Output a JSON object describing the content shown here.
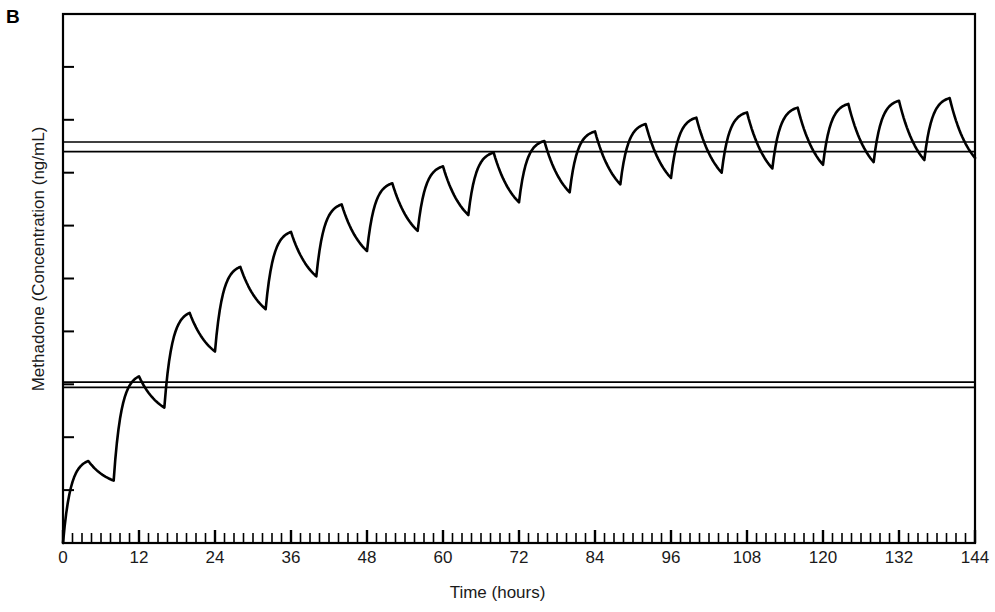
{
  "figure": {
    "panel_label": "B",
    "background": "#ffffff",
    "line_color": "#000000"
  },
  "chart_data": {
    "type": "line",
    "title": "",
    "subtitle": "",
    "panel": "B",
    "xlabel": "Time (hours)",
    "ylabel": "Methadone (Concentration (ng/mL)",
    "xlim": [
      0,
      144
    ],
    "ylim": [
      0,
      10
    ],
    "grid": false,
    "legend": null,
    "xticks": [
      0,
      12,
      24,
      36,
      48,
      60,
      72,
      84,
      96,
      108,
      120,
      132,
      144
    ],
    "xticklabels": [
      "0",
      "12",
      "24",
      "36",
      "48",
      "60",
      "72",
      "84",
      "96",
      "108",
      "120",
      "132",
      "144"
    ],
    "x_minor_tick_interval": 1.5,
    "yticks": [
      1,
      2,
      3,
      4,
      5,
      6,
      7,
      8,
      9
    ],
    "yticklabels": [
      "",
      "",
      "",
      "",
      "",
      "",
      "",
      "",
      ""
    ],
    "y_axis_labeled": false,
    "dose_interval_hours": 8,
    "doses": 18,
    "annotations": [],
    "reference_lines": [
      {
        "name": "upper-band-top",
        "y": 7.58,
        "style": "solid",
        "color": "#000000"
      },
      {
        "name": "upper-band-bottom",
        "y": 7.4,
        "style": "solid",
        "color": "#000000"
      },
      {
        "name": "lower-band-top",
        "y": 3.04,
        "style": "solid",
        "color": "#000000"
      },
      {
        "name": "lower-band-bottom",
        "y": 2.94,
        "style": "solid",
        "color": "#000000"
      }
    ],
    "series": [
      {
        "name": "Methadone concentration",
        "color": "#000000",
        "peaks_x": [
          4,
          12,
          20,
          28,
          36,
          44,
          52,
          60,
          68,
          76,
          84,
          92,
          100,
          108,
          116,
          124,
          132,
          140
        ],
        "peaks_y": [
          1.55,
          3.15,
          4.35,
          5.22,
          5.88,
          6.4,
          6.8,
          7.12,
          7.38,
          7.6,
          7.78,
          7.92,
          8.04,
          8.14,
          8.23,
          8.3,
          8.36,
          8.41
        ],
        "troughs_x": [
          8,
          16,
          24,
          32,
          40,
          48,
          56,
          64,
          72,
          80,
          88,
          96,
          104,
          112,
          120,
          128,
          136,
          144
        ],
        "troughs_y": [
          1.18,
          2.56,
          3.62,
          4.42,
          5.04,
          5.52,
          5.9,
          6.2,
          6.44,
          6.63,
          6.78,
          6.9,
          7.0,
          7.08,
          7.15,
          7.2,
          7.24,
          7.28
        ],
        "start_point": {
          "x": 0,
          "y": 0
        },
        "end_point": {
          "x": 144,
          "y": 7.28
        }
      }
    ]
  }
}
